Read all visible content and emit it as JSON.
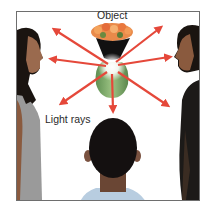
{
  "diagram": {
    "labels": {
      "object": "Object",
      "light_rays": "Light rays"
    },
    "colors": {
      "arrow": "#e5483a",
      "frame_border": "#6e6e6e",
      "vase_green": "#7fae6a",
      "flowers": "#e98a4a",
      "glow": "#ffffff",
      "hair": "#1a1410",
      "skin": "#8a5a3e",
      "shirt_left": "#9a9a9a",
      "shirt_right": "#1c1a18",
      "shirt_center": "#b8cde0"
    },
    "source_point": [
      112,
      67
    ],
    "rays": [
      {
        "direction": "upper-left",
        "tip": [
          50,
          27
        ]
      },
      {
        "direction": "left",
        "tip": [
          47,
          59
        ]
      },
      {
        "direction": "lower-left",
        "tip": [
          57,
          107
        ]
      },
      {
        "direction": "down",
        "tip": [
          113,
          116
        ]
      },
      {
        "direction": "lower-right",
        "tip": [
          172,
          109
        ]
      },
      {
        "direction": "right",
        "tip": [
          175,
          56
        ]
      },
      {
        "direction": "upper-right",
        "tip": [
          165,
          24
        ]
      }
    ],
    "elements": [
      "vase-with-flowers",
      "observer-left",
      "observer-right",
      "observer-center-back"
    ]
  }
}
